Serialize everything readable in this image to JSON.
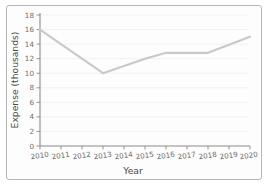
{
  "chart_data": {
    "type": "line",
    "title": "",
    "xlabel": "Year",
    "ylabel": "Expense (thousands)",
    "categories": [
      "2010",
      "2011",
      "2012",
      "2013",
      "2014",
      "2015",
      "2016",
      "2017",
      "2018",
      "2019",
      "2020"
    ],
    "x": [
      2010,
      2011,
      2012,
      2013,
      2014,
      2015,
      2016,
      2017,
      2018,
      2019,
      2020
    ],
    "values": [
      16,
      14,
      12,
      10,
      11,
      12,
      12.8,
      12.8,
      12.8,
      13.9,
      15
    ],
    "series": [
      {
        "name": "Expense",
        "values": [
          16,
          14,
          12,
          10,
          11,
          12,
          12.8,
          12.8,
          12.8,
          13.9,
          15
        ],
        "color": "#c9c9c9"
      }
    ],
    "ylim": [
      0,
      18
    ],
    "xlim": [
      2010,
      2020
    ],
    "yticks": [
      0,
      2,
      4,
      6,
      8,
      10,
      12,
      14,
      16,
      18
    ],
    "ytick_labels": [
      "0",
      "2",
      "4",
      "6",
      "8",
      "10",
      "12",
      "14",
      "16",
      "18"
    ],
    "xticks": [
      2010,
      2011,
      2012,
      2013,
      2014,
      2015,
      2016,
      2017,
      2018,
      2019,
      2020
    ],
    "xtick_labels": [
      "2010",
      "2011",
      "2012",
      "2013",
      "2014",
      "2015",
      "2016",
      "2017",
      "2018",
      "2019",
      "2020"
    ],
    "grid": true,
    "grid_axis": "y",
    "legend": false,
    "legend_position": "none"
  },
  "axes": {
    "y_title": "Expense (thousands)",
    "x_title": "Year"
  }
}
